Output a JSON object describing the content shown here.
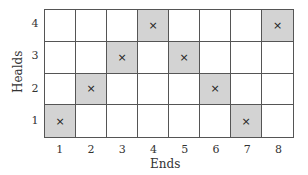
{
  "diagram": {
    "type": "weave-draft",
    "x_axis_label": "Ends",
    "y_axis_label": "Healds",
    "x_ticks": [
      "1",
      "2",
      "3",
      "4",
      "5",
      "6",
      "7",
      "8"
    ],
    "y_ticks_top_to_bottom": [
      "4",
      "3",
      "2",
      "1"
    ],
    "mark_symbol": "×",
    "filled_color": "#d3d3d3",
    "rows": [
      {
        "heald": "4",
        "marked_ends": [
          4,
          8
        ]
      },
      {
        "heald": "3",
        "marked_ends": [
          3,
          5
        ]
      },
      {
        "heald": "2",
        "marked_ends": [
          2,
          6
        ]
      },
      {
        "heald": "1",
        "marked_ends": [
          1,
          7
        ]
      }
    ]
  }
}
